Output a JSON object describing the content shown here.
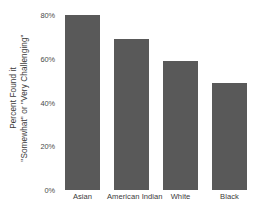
{
  "chart_data": {
    "type": "bar",
    "title": "",
    "xlabel": "",
    "ylabel": "Percent Found it \"Somewhat\" or \"Very Challenging\"",
    "ylabel_lines": [
      "Percent Found it",
      "\"Somewhat\" or \"Very Challenging\""
    ],
    "categories": [
      "Asian",
      "American Indian",
      "White",
      "Black"
    ],
    "values": [
      80,
      69,
      59,
      49
    ],
    "ylim": [
      0,
      80
    ],
    "ytick_values": [
      0,
      20,
      40,
      60,
      80
    ],
    "ytick_labels": [
      "0%",
      "20%",
      "40%",
      "60%",
      "80%"
    ],
    "grid": false,
    "legend": "none",
    "bar_color": "#595959",
    "background_color": "#ffffff",
    "text_color": "#3a3a3a"
  }
}
